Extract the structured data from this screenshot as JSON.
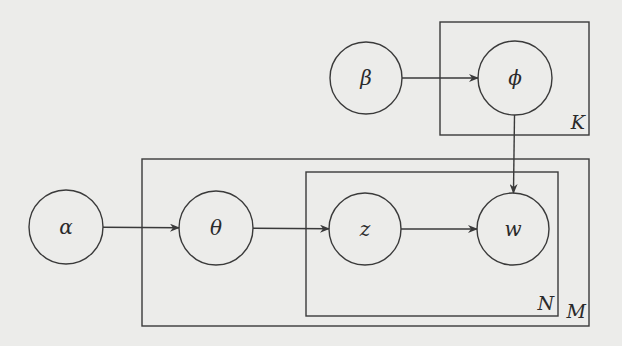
{
  "diagram": {
    "type": "plate-notation graphical model",
    "nodes": [
      {
        "id": "alpha",
        "label": "α",
        "cx": 66,
        "cy": 227,
        "r": 37
      },
      {
        "id": "theta",
        "label": "θ",
        "cx": 216,
        "cy": 228,
        "r": 37
      },
      {
        "id": "z",
        "label": "z",
        "cx": 365,
        "cy": 229,
        "r": 36
      },
      {
        "id": "w",
        "label": "w",
        "cx": 513,
        "cy": 229,
        "r": 36
      },
      {
        "id": "beta",
        "label": "β",
        "cx": 366,
        "cy": 78,
        "r": 36
      },
      {
        "id": "phi",
        "label": "ϕ",
        "cx": 515,
        "cy": 78,
        "r": 37
      }
    ],
    "edges": [
      {
        "from": "alpha",
        "to": "theta"
      },
      {
        "from": "theta",
        "to": "z"
      },
      {
        "from": "z",
        "to": "w"
      },
      {
        "from": "beta",
        "to": "phi"
      },
      {
        "from": "phi",
        "to": "w"
      }
    ],
    "plates": [
      {
        "id": "K",
        "label": "K",
        "x": 440,
        "y": 22,
        "w": 149,
        "h": 113
      },
      {
        "id": "M",
        "label": "M",
        "x": 142,
        "y": 159,
        "w": 447,
        "h": 167
      },
      {
        "id": "N",
        "label": "N",
        "x": 306,
        "y": 172,
        "w": 252,
        "h": 144
      }
    ]
  }
}
